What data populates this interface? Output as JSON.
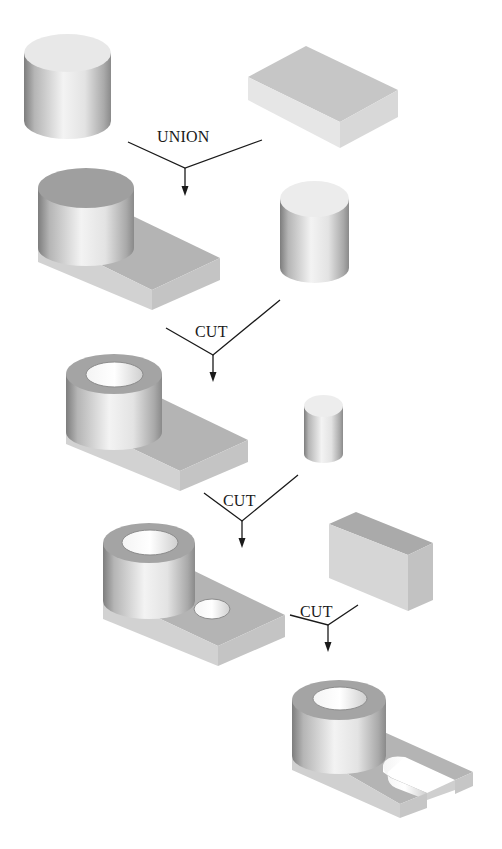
{
  "diagram": {
    "type": "CSG boolean operation sequence",
    "steps": [
      {
        "operation": "UNION",
        "inputs": [
          "cylinder",
          "rectangular block"
        ],
        "result": "cylinder on block"
      },
      {
        "operation": "CUT",
        "inputs": [
          "cylinder on block",
          "cylinder"
        ],
        "result": "hollow cylinder on block"
      },
      {
        "operation": "CUT",
        "inputs": [
          "hollow cylinder on block",
          "small cylinder"
        ],
        "result": "block with hole"
      },
      {
        "operation": "CUT",
        "inputs": [
          "block with hole",
          "rectangular block"
        ],
        "result": "slotted bracket"
      }
    ]
  },
  "labels": {
    "union": "UNION",
    "cut1": "CUT",
    "cut2": "CUT",
    "cut3": "CUT"
  },
  "colors": {
    "background": "#ffffff",
    "line": "#1a1a1a",
    "face_light": "#e2e2e2",
    "face_mid": "#c4c4c4",
    "face_dark": "#a8a8a8"
  }
}
